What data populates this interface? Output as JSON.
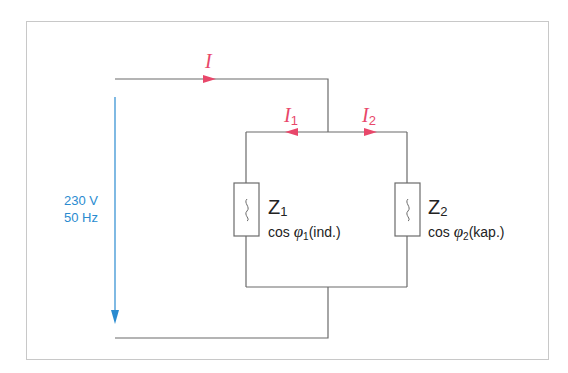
{
  "diagram": {
    "type": "parallel AC circuit",
    "colors": {
      "wire": "#6b6b6b",
      "current": "#e8476a",
      "source": "#2a8bd0",
      "frame": "#c8c8c8"
    },
    "currents": {
      "total": {
        "symbol": "I",
        "subscript": ""
      },
      "branch1": {
        "symbol": "I",
        "subscript": "1"
      },
      "branch2": {
        "symbol": "I",
        "subscript": "2"
      }
    },
    "source": {
      "voltage": "230 V",
      "frequency": "50 Hz"
    },
    "impedances": [
      {
        "symbol": "Z",
        "subscript": "1",
        "cos_prefix": "cos ",
        "phi": "φ",
        "phi_sub": "1",
        "cos_suffix": "(ind.)",
        "icon": "ac-wave-icon"
      },
      {
        "symbol": "Z",
        "subscript": "2",
        "cos_prefix": "cos ",
        "phi": "φ",
        "phi_sub": "2",
        "cos_suffix": "(kap.)",
        "icon": "ac-wave-icon"
      }
    ]
  }
}
